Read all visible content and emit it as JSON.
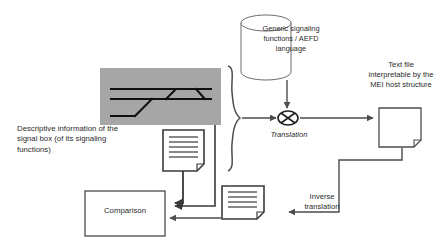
{
  "diagram": {
    "colors": {
      "stroke": "#4c4c4c",
      "stroke_dark": "#1a1a1a",
      "text": "#2b2b2b",
      "gray_panel": "#a6a6a6",
      "background": "#ffffff"
    },
    "nodes": {
      "cylinder": {
        "label": "Generic signaling\nfunctions / AEFD\nlanguage",
        "shape": "cylinder"
      },
      "textfile": {
        "label": "Text file\ninterpretable by the\nMEI host structure",
        "shape": "document-page"
      },
      "descriptive": {
        "label": "Descriptive information of the\nsignal box (of its signaling\nfunctions)",
        "shape": "text"
      },
      "translation": {
        "label": "Translation",
        "shape": "crossed-ellipse"
      },
      "inverse_translation": {
        "label": "Inverse\ntranslation",
        "shape": "text"
      },
      "comparison": {
        "label": "Comparison",
        "shape": "rectangle"
      },
      "track_panel": {
        "label": "",
        "shape": "gray-panel-with-railway-schematic"
      },
      "doc_upper": {
        "label": "",
        "shape": "document-icon",
        "line_count": 7
      },
      "doc_lower": {
        "label": "",
        "shape": "document-icon",
        "line_count": 5
      }
    }
  }
}
